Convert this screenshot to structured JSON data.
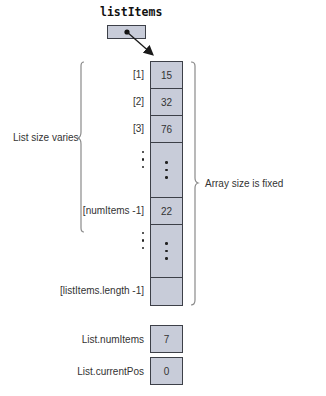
{
  "pointer": {
    "label": "listItems",
    "target": "array-cell-0"
  },
  "array": {
    "cells": [
      {
        "index": "[1]",
        "value": "15"
      },
      {
        "index": "[2]",
        "value": "32"
      },
      {
        "index": "[3]",
        "value": "76"
      },
      {
        "index": "",
        "value": "",
        "ellipsis": true
      },
      {
        "index": "[numItems -1]",
        "value": "22"
      },
      {
        "index": "",
        "value": "",
        "ellipsis": true
      },
      {
        "index": "[listItems.length -1]",
        "value": ""
      }
    ]
  },
  "annotations": {
    "left_brace_label": "List size varies",
    "right_brace_label": "Array size is fixed"
  },
  "fields": [
    {
      "label": "List.numItems",
      "value": "7"
    },
    {
      "label": "List.currentPos",
      "value": "0"
    }
  ],
  "colors": {
    "box_fill": "#c8ccd9",
    "box_border": "#3d4048",
    "brace": "#8a8a8a"
  }
}
